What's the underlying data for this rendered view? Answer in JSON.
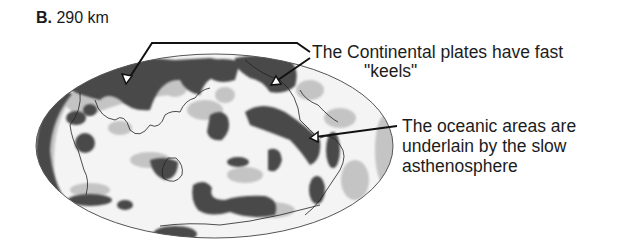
{
  "panel": {
    "letter": "B.",
    "depth_label": "290 km"
  },
  "map": {
    "projection": "Hammer/Mollweide (elliptical global map)",
    "legend": {
      "fast_color": "#4a4a4a",
      "intermediate_color": "#bcbcbc",
      "slow_color": "#f4f4f4"
    }
  },
  "annotations": {
    "continental": {
      "line1": "The Continental plates have fast",
      "line2": "\"keels\""
    },
    "oceanic": {
      "line1": "The oceanic areas are",
      "line2": "underlain by the slow",
      "line3": "asthenosphere"
    }
  }
}
